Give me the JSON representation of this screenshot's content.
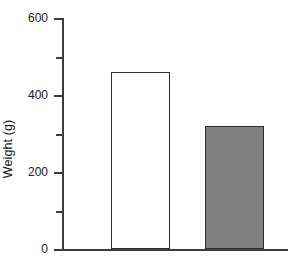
{
  "chart_data": {
    "type": "bar",
    "title": "",
    "subtitle": "",
    "xlabel": "",
    "ylabel": "Weight (g)",
    "categories": [
      "",
      ""
    ],
    "values": [
      460,
      320
    ],
    "series": [
      {
        "name": "Weight",
        "values": [
          460,
          320
        ]
      }
    ],
    "bar_styles": [
      {
        "fill": "#ffffff",
        "edge": "#2e2e2e"
      },
      {
        "fill": "#808080",
        "edge": "#2e2e2e"
      }
    ],
    "ylim": [
      0,
      600
    ],
    "y_major_ticks": [
      0,
      200,
      400,
      600
    ],
    "y_minor_ticks": [
      100,
      300,
      500
    ],
    "y_tick_labels": [
      "0",
      "200",
      "400",
      "600"
    ],
    "x_tick_labels": [],
    "grid": false,
    "legend": null,
    "legend_position": "none",
    "annotations": [],
    "axis_color": "#3b3b3b",
    "text_color": "#161616",
    "background": "#ffffff"
  },
  "axis_geometry": {
    "x_axis_left_px": 62,
    "x_axis_right_px": 288,
    "baseline_y_px": 249,
    "top_y_px": 18,
    "px_per_unit": 0.385
  },
  "bars_geometry": [
    {
      "left_px": 111,
      "right_px": 170,
      "top_px": 71
    },
    {
      "left_px": 205,
      "right_px": 264,
      "top_px": 124
    }
  ]
}
